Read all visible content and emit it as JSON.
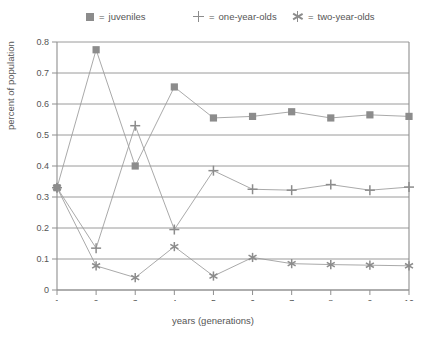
{
  "legend": {
    "items": [
      {
        "marker": "square-marker",
        "eq": "=",
        "label": "juveniles"
      },
      {
        "marker": "plus-marker",
        "eq": "=",
        "label": "one-year-olds"
      },
      {
        "marker": "asterisk-marker",
        "eq": "=",
        "label": "two-year-olds"
      }
    ]
  },
  "axes": {
    "y_ticks": [
      "0.8",
      "0.7",
      "0.6",
      "0.5",
      "0.4",
      "0.3",
      "0.2",
      "0.1",
      "0"
    ],
    "x_ticks": [
      "1",
      "2",
      "3",
      "4",
      "5",
      "6",
      "7",
      "8",
      "9",
      "10"
    ],
    "ylabel": "percent of population",
    "xlabel": "years (generations)"
  },
  "colors": {
    "line": "#9a9a9a",
    "marker": "#8c8c8c",
    "axis": "#8f8f8f",
    "text": "#555555",
    "background": "#ffffff"
  },
  "chart_data": {
    "type": "line",
    "title": "",
    "xlabel": "years (generations)",
    "ylabel": "percent of population",
    "x": [
      1,
      2,
      3,
      4,
      5,
      6,
      7,
      8,
      9,
      10
    ],
    "xlim": [
      1,
      10
    ],
    "ylim": [
      0,
      0.8
    ],
    "ytick_values": [
      0,
      0.1,
      0.2,
      0.3,
      0.4,
      0.5,
      0.6,
      0.7,
      0.8
    ],
    "grid": true,
    "legend_position": "top",
    "series": [
      {
        "name": "juveniles",
        "marker": "square",
        "values": [
          0.33,
          0.775,
          0.4,
          0.655,
          0.555,
          0.56,
          0.575,
          0.555,
          0.565,
          0.56
        ]
      },
      {
        "name": "one-year-olds",
        "marker": "plus",
        "values": [
          0.33,
          0.135,
          0.53,
          0.195,
          0.385,
          0.325,
          0.322,
          0.34,
          0.322,
          0.332
        ]
      },
      {
        "name": "two-year-olds",
        "marker": "asterisk",
        "values": [
          0.33,
          0.078,
          0.04,
          0.14,
          0.045,
          0.105,
          0.085,
          0.082,
          0.08,
          0.078
        ]
      }
    ]
  }
}
